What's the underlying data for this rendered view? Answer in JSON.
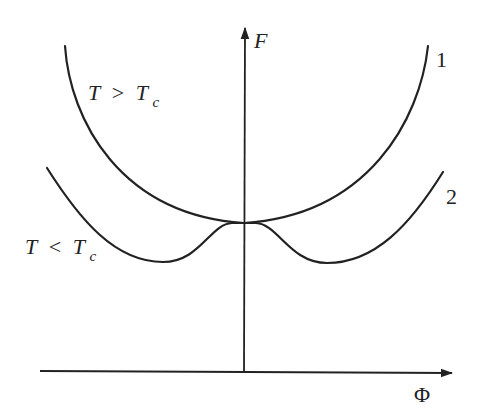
{
  "diagram": {
    "type": "free-energy-vs-order-parameter",
    "axes": {
      "y_label": "F",
      "x_label": "Φ"
    },
    "curves": [
      {
        "id": "1",
        "label": "1",
        "condition": {
          "T": "T",
          "op": ">",
          "Tc": "T",
          "sub": "c"
        },
        "shape": "single well, minimum at Φ = 0"
      },
      {
        "id": "2",
        "label": "2",
        "condition": {
          "T": "T",
          "op": "<",
          "Tc": "T",
          "sub": "c"
        },
        "shape": "double well, local maximum at Φ = 0, two symmetric minima"
      }
    ],
    "colors": {
      "ink": "#222222",
      "background": "#ffffff"
    }
  }
}
